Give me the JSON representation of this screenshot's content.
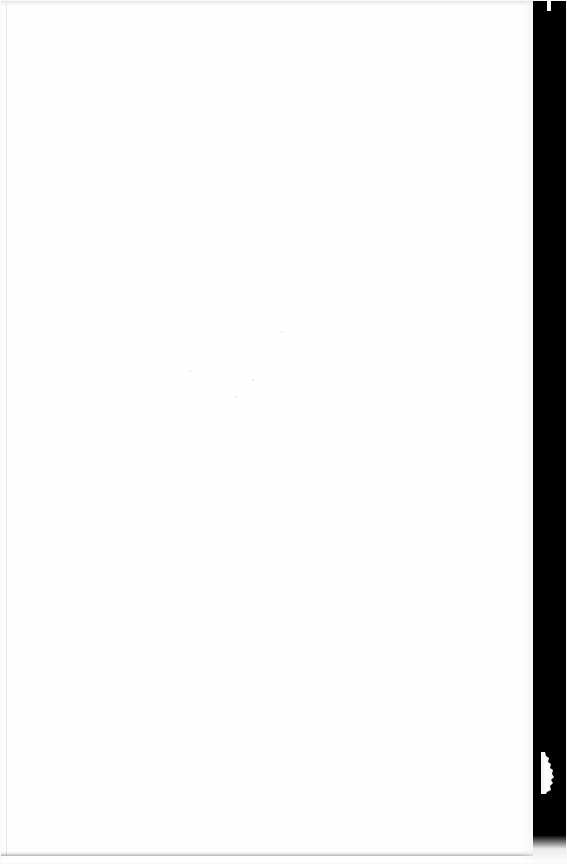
{
  "document": {
    "kind": "scanned-page",
    "page_content": "",
    "page_text": "",
    "note": "Blank scanned page — no printed text, headings, figures or page number are visible."
  },
  "canvas": {
    "width": 567,
    "height": 864,
    "background_color": "#ffffff"
  },
  "paper": {
    "label": "",
    "color": "#fefefe",
    "width": 552,
    "height": 860
  },
  "scanner_bed": {
    "label": "",
    "color": "#000000",
    "side": "right",
    "width": 34,
    "fades_out_near_bottom": true
  },
  "edge_artifacts": {
    "page_curl_shadow_color": "#e4e4e9",
    "page_edge_highlight_color": "#ffffff",
    "left_margin_line_color": "#cdcdd2",
    "top_scan_band_color": "#c4c4ca",
    "bottom_scan_band_color": "#96969e",
    "torn_edge_color": "#f4f4f6"
  },
  "dust_specks": [
    {
      "x": 281,
      "y": 331,
      "size": 2
    },
    {
      "x": 284,
      "y": 337,
      "size": 1
    },
    {
      "x": 288,
      "y": 334,
      "size": 1
    },
    {
      "x": 189,
      "y": 370,
      "size": 2
    },
    {
      "x": 252,
      "y": 379,
      "size": 2
    },
    {
      "x": 276,
      "y": 386,
      "size": 1
    },
    {
      "x": 235,
      "y": 396,
      "size": 2
    },
    {
      "x": 235,
      "y": 412,
      "size": 1
    },
    {
      "x": 243,
      "y": 428,
      "size": 1
    },
    {
      "x": 332,
      "y": 420,
      "size": 1
    },
    {
      "x": 150,
      "y": 490,
      "size": 1
    },
    {
      "x": 168,
      "y": 487,
      "size": 1
    },
    {
      "x": 155,
      "y": 494,
      "size": 1
    },
    {
      "x": 355,
      "y": 482,
      "size": 1
    },
    {
      "x": 361,
      "y": 484,
      "size": 1
    },
    {
      "x": 310,
      "y": 545,
      "size": 1
    },
    {
      "x": 228,
      "y": 490,
      "size": 1
    },
    {
      "x": 58,
      "y": 576,
      "size": 1
    },
    {
      "x": 67,
      "y": 619,
      "size": 1
    },
    {
      "x": 103,
      "y": 697,
      "size": 1
    },
    {
      "x": 420,
      "y": 700,
      "size": 1
    },
    {
      "x": 398,
      "y": 615,
      "size": 1
    }
  ],
  "torn_edge": {
    "label": "",
    "top": 752,
    "height": 42
  }
}
